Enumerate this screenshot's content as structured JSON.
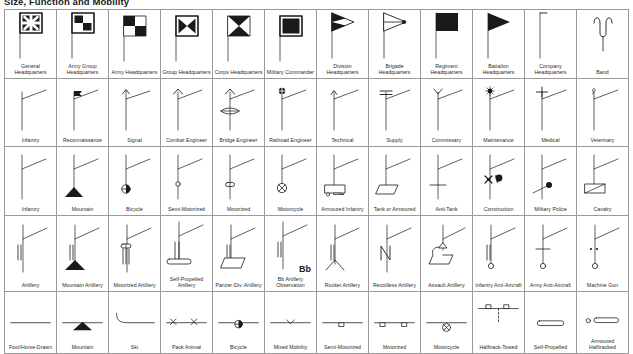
{
  "page": {
    "title": "Size, Function and Mobility"
  },
  "table": {
    "columns": 12,
    "rows": [
      {
        "name": "headquarters-row",
        "cells": [
          {
            "label": "General\nHeadquarters",
            "symbol": "flag-quadrant-star"
          },
          {
            "label": "Army Group\nHeadquarters",
            "symbol": "flag-checker-4"
          },
          {
            "label": "Army Headquarters",
            "symbol": "flag-checker-plain"
          },
          {
            "label": "Group Headquarters",
            "symbol": "flag-bowtie-horizontal"
          },
          {
            "label": "Corps Headquarters",
            "symbol": "flag-bowtie-vertical"
          },
          {
            "label": "Military Commander",
            "symbol": "flag-solid-square"
          },
          {
            "label": "Division\nHeadquarters",
            "symbol": "pennant-half-filled"
          },
          {
            "label": "Brigade\nHeadquarters",
            "symbol": "pennant-outline-dot"
          },
          {
            "label": "Regiment\nHeadquarters",
            "symbol": "flag-solid-rect"
          },
          {
            "label": "Battalion\nHeadquarters",
            "symbol": "pennant-solid"
          },
          {
            "label": "Company\nHeadquarters",
            "symbol": "flag-small-tick"
          },
          {
            "label": "Band",
            "symbol": "lyre"
          }
        ]
      },
      {
        "name": "branch-row",
        "cells": [
          {
            "label": "Infantry",
            "symbol": "staff-plain"
          },
          {
            "label": "Reconnaissance",
            "symbol": "staff-small-flag"
          },
          {
            "label": "Signal",
            "symbol": "staff-arrow"
          },
          {
            "label": "Combat Engineer",
            "symbol": "staff-chevron"
          },
          {
            "label": "Bridge Engineer",
            "symbol": "staff-chevron-bridge"
          },
          {
            "label": "Railroad Engineer",
            "symbol": "staff-wheel-top"
          },
          {
            "label": "Technical",
            "symbol": "staff-arrow-small"
          },
          {
            "label": "Supply",
            "symbol": "staff-double-bar"
          },
          {
            "label": "Commissary",
            "symbol": "staff-y"
          },
          {
            "label": "Maintenance",
            "symbol": "staff-star-dot"
          },
          {
            "label": "Medical",
            "symbol": "staff-cross"
          },
          {
            "label": "Veterinary",
            "symbol": "staff-script"
          }
        ]
      },
      {
        "name": "infantry-mobility-row",
        "cells": [
          {
            "label": "Infantry",
            "symbol": "inf-plain"
          },
          {
            "label": "Mountain",
            "symbol": "inf-triangle"
          },
          {
            "label": "Bicycle",
            "symbol": "inf-wheel"
          },
          {
            "label": "Semi-Motorized",
            "symbol": "inf-circle-small"
          },
          {
            "label": "Motorized",
            "symbol": "inf-oval"
          },
          {
            "label": "Motorcycle",
            "symbol": "inf-circle-x"
          },
          {
            "label": "Armoured Infantry",
            "symbol": "inf-halftrack-box"
          },
          {
            "label": "Tank or Armoured",
            "symbol": "inf-parallelogram"
          },
          {
            "label": "Anti-Tank",
            "symbol": "inf-crossbar"
          },
          {
            "label": "Construction",
            "symbol": "inf-tools"
          },
          {
            "label": "Military Police",
            "symbol": "inf-dot-arm"
          },
          {
            "label": "Cavalry",
            "symbol": "inf-slash-box"
          }
        ]
      },
      {
        "name": "artillery-row",
        "cells": [
          {
            "label": "Artillery",
            "symbol": "art-plain"
          },
          {
            "label": "Mountain Artillery",
            "symbol": "art-triangle"
          },
          {
            "label": "Motorized Artillery",
            "symbol": "art-oval"
          },
          {
            "label": "Self-Propelled\nArtillery",
            "symbol": "art-track"
          },
          {
            "label": "Panzer-Div. Artillery",
            "symbol": "art-parallelogram"
          },
          {
            "label": "Bb Artillery\nObservation",
            "symbol": "art-bb",
            "annotation": "Bb"
          },
          {
            "label": "Rocket Artillery",
            "symbol": "art-rocket"
          },
          {
            "label": "Recoilless Artillery",
            "symbol": "art-n"
          },
          {
            "label": "Assault Artillery",
            "symbol": "art-assault"
          },
          {
            "label": "Infantry Anti-Aircraft",
            "symbol": "aa-double-ring"
          },
          {
            "label": "Army Anti-Aircraft",
            "symbol": "aa-cross-ring"
          },
          {
            "label": "Machine Gun",
            "symbol": "mg-dots-ring"
          }
        ]
      },
      {
        "name": "transport-mobility-row",
        "cells": [
          {
            "label": "Foot/Horse-Drawn",
            "symbol": "t-line"
          },
          {
            "label": "Mountain",
            "symbol": "t-triangle"
          },
          {
            "label": "Ski",
            "symbol": "t-ski"
          },
          {
            "label": "Pack Animal",
            "symbol": "t-pack"
          },
          {
            "label": "Bicycle",
            "symbol": "t-wheel"
          },
          {
            "label": "Mixed Mobility",
            "symbol": "t-mixed"
          },
          {
            "label": "Semi-Motorized",
            "symbol": "t-semi"
          },
          {
            "label": "Motorized",
            "symbol": "t-motor"
          },
          {
            "label": "Motorcycle",
            "symbol": "t-motorcycle"
          },
          {
            "label": "Halftrack-Towed",
            "symbol": "t-halftrack-towed"
          },
          {
            "label": "Self-Propelled",
            "symbol": "t-selfprop"
          },
          {
            "label": "Armoured Halftracked",
            "symbol": "t-armoured-halftrack"
          }
        ]
      }
    ]
  },
  "colors": {
    "border": "#9a9a9a",
    "ink": "#1a1a1a",
    "caption": "#2a2a2a",
    "background": "#ffffff"
  }
}
